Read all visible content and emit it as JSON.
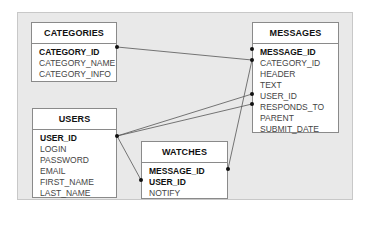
{
  "diagram": {
    "type": "entity-relationship",
    "entities": [
      {
        "id": "categories",
        "title": "CATEGORIES",
        "fields": [
          {
            "name": "CATEGORY_ID",
            "key": true
          },
          {
            "name": "CATEGORY_NAME",
            "key": false
          },
          {
            "name": "CATEGORY_INFO",
            "key": false
          }
        ]
      },
      {
        "id": "messages",
        "title": "MESSAGES",
        "fields": [
          {
            "name": "MESSAGE_ID",
            "key": true
          },
          {
            "name": "CATEGORY_ID",
            "key": false
          },
          {
            "name": "HEADER",
            "key": false
          },
          {
            "name": "TEXT",
            "key": false
          },
          {
            "name": "USER_ID",
            "key": false
          },
          {
            "name": "RESPONDS_TO",
            "key": false
          },
          {
            "name": "PARENT",
            "key": false
          },
          {
            "name": "SUBMIT_DATE",
            "key": false
          }
        ]
      },
      {
        "id": "users",
        "title": "USERS",
        "fields": [
          {
            "name": "USER_ID",
            "key": true
          },
          {
            "name": "LOGIN",
            "key": false
          },
          {
            "name": "PASSWORD",
            "key": false
          },
          {
            "name": "EMAIL",
            "key": false
          },
          {
            "name": "FIRST_NAME",
            "key": false
          },
          {
            "name": "LAST_NAME",
            "key": false
          }
        ]
      },
      {
        "id": "watches",
        "title": "WATCHES",
        "fields": [
          {
            "name": "MESSAGE_ID",
            "key": true
          },
          {
            "name": "USER_ID",
            "key": true
          },
          {
            "name": "NOTIFY",
            "key": false
          }
        ]
      }
    ],
    "relationships": [
      {
        "from": "CATEGORIES.CATEGORY_ID",
        "to": "MESSAGES.CATEGORY_ID"
      },
      {
        "from": "USERS.USER_ID",
        "to": "MESSAGES.USER_ID"
      },
      {
        "from": "USERS.USER_ID",
        "to": "MESSAGES.RESPONDS_TO"
      },
      {
        "from": "USERS.USER_ID",
        "to": "WATCHES.USER_ID"
      },
      {
        "from": "MESSAGES.CATEGORY_ID",
        "to": "WATCHES.MESSAGE_ID"
      }
    ],
    "colors": {
      "background": "#e9e9e9",
      "entity_fill": "#ffffff",
      "border": "#8a8a8a",
      "line": "#555555"
    }
  }
}
